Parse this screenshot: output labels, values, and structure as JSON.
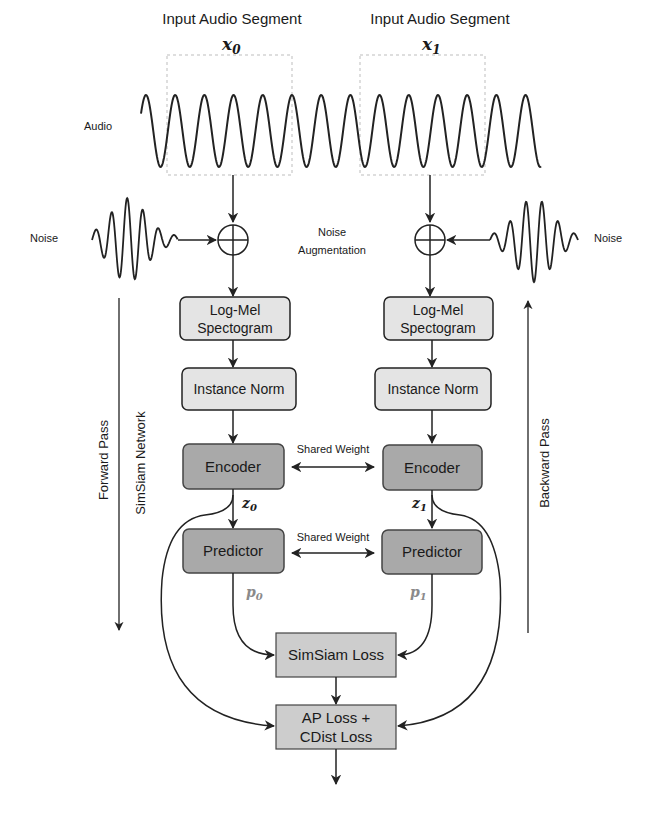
{
  "colors": {
    "stroke": "#222222",
    "light_box": "#e4e4e4",
    "dark_box": "#a9a9a9",
    "loss_box": "#cdcdcd",
    "dashed": "#bdbdbd",
    "p_label": "#8a8a8a"
  },
  "inputs": {
    "left": {
      "title": "Input Audio Segment",
      "symbol": "x",
      "sub": "0"
    },
    "right": {
      "title": "Input Audio Segment",
      "symbol": "x",
      "sub": "1"
    }
  },
  "labels": {
    "audio": "Audio",
    "noise_left": "Noise",
    "noise_right": "Noise",
    "noise_aug_line1": "Noise",
    "noise_aug_line2": "Augmentation",
    "forward_pass": "Forward Pass",
    "simsiam_network": "SimSiam Network",
    "backward_pass": "Backward Pass",
    "shared_weight_encoder": "Shared Weight",
    "shared_weight_predictor": "Shared Weight",
    "z0": "z",
    "z0_sub": "0",
    "z1": "z",
    "z1_sub": "1",
    "p0": "p",
    "p0_sub": "0",
    "p1": "p",
    "p1_sub": "1"
  },
  "blocks": {
    "logmel_line1": "Log-Mel",
    "logmel_line2": "Spectogram",
    "instance_norm": "Instance Norm",
    "encoder": "Encoder",
    "predictor": "Predictor",
    "simsiam_loss": "SimSiam Loss",
    "final_loss_line1": "AP Loss +",
    "final_loss_line2": "CDist Loss"
  }
}
